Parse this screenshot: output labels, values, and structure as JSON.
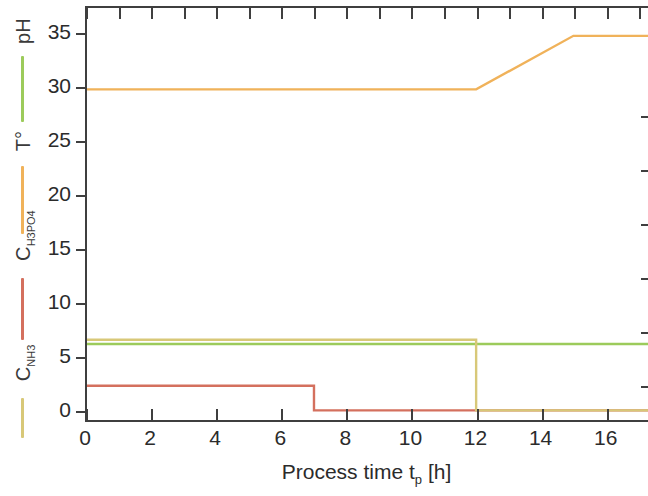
{
  "chart_data": {
    "type": "line",
    "title": "",
    "xlabel": "Process time t_p [h]",
    "xlabel_main": "Process time t",
    "xlabel_sub": "p",
    "xlabel_unit": " [h]",
    "ylabel": "",
    "xlim": [
      0,
      17.3
    ],
    "ylim": [
      -0.9,
      37.6
    ],
    "xticks": [
      0,
      2,
      4,
      6,
      8,
      10,
      12,
      14,
      16
    ],
    "xticklabels": [
      "0",
      "2",
      "4",
      "6",
      "8",
      "10",
      "12",
      "14",
      "16"
    ],
    "yticks": [
      0,
      5,
      10,
      15,
      20,
      25,
      30,
      35
    ],
    "yticklabels": [
      "0",
      "5",
      "10",
      "15",
      "20",
      "25",
      "30",
      "35"
    ],
    "grid": false,
    "legend_position": "left-outside-vertical",
    "series": [
      {
        "name": "pH",
        "label": "pH",
        "color": "#9CCB5B",
        "x": [
          0,
          7,
          12,
          15,
          17.3
        ],
        "values": [
          6.2,
          6.2,
          6.2,
          6.2,
          6.2
        ]
      },
      {
        "name": "T",
        "label": "T°",
        "color": "#F0B25A",
        "x": [
          0,
          7,
          12,
          15,
          17.3
        ],
        "values": [
          30,
          30,
          30,
          35,
          35
        ]
      },
      {
        "name": "C_H3PO4",
        "label": "C_H3PO4",
        "label_main": "C",
        "label_sub": "H3PO4",
        "color": "#D4705E",
        "x": [
          0,
          7,
          7,
          12,
          15,
          17.3
        ],
        "values": [
          2.3,
          2.3,
          0,
          0,
          0,
          0
        ]
      },
      {
        "name": "C_NH3",
        "label": "C_NH3",
        "label_main": "C",
        "label_sub": "NH3",
        "color": "#D8C878",
        "x": [
          0,
          7,
          12,
          12,
          15,
          17.3
        ],
        "values": [
          6.6,
          6.6,
          6.6,
          0,
          0,
          0
        ]
      }
    ],
    "annotations": []
  },
  "legend": {
    "items": [
      {
        "label_main": "pH",
        "label_sub": "",
        "color": "#9CCB5B"
      },
      {
        "label_main": "T°",
        "label_sub": "",
        "color": "#F0B25A"
      },
      {
        "label_main": "C",
        "label_sub": "H3PO4",
        "color": "#D4705E"
      },
      {
        "label_main": "C",
        "label_sub": "NH3",
        "color": "#D8C878"
      }
    ]
  },
  "axis": {
    "line_color": "#3f3f3f",
    "text_color": "#2b2b2b"
  }
}
